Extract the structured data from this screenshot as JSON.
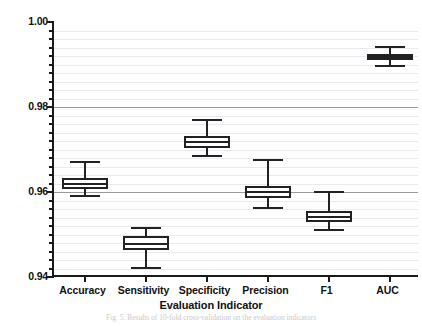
{
  "figure": {
    "width": 422,
    "height": 327,
    "background": "#ffffff",
    "line_color": "#222222",
    "grid_major_color": "#9a9a9a",
    "grid_minor_color": "#e9e9ef",
    "caption": "Fig. 5. Results of 10-fold cross-validation on the evaluation indicators"
  },
  "chart_data": {
    "type": "box",
    "title": "",
    "xlabel": "Evaluation Indicator",
    "ylabel": "",
    "ylim": [
      0.94,
      1.0
    ],
    "ytick_labels": [
      "0.94",
      "0.96",
      "0.98",
      "1.00"
    ],
    "ytick_values": [
      0.94,
      0.96,
      0.98,
      1.0
    ],
    "ytick_minor_step": 0.002,
    "grid": true,
    "legend": "none",
    "categories": [
      "Accuracy",
      "Sensitivity",
      "Specificity",
      "Precision",
      "F1",
      "AUC"
    ],
    "boxes": [
      {
        "name": "Accuracy",
        "whisker_high": 0.9671,
        "q3": 0.9633,
        "median": 0.9619,
        "q1": 0.9607,
        "whisker_low": 0.9591
      },
      {
        "name": "Sensitivity",
        "whisker_high": 0.9515,
        "q3": 0.9497,
        "median": 0.9478,
        "q1": 0.9464,
        "whisker_low": 0.9421
      },
      {
        "name": "Specificity",
        "whisker_high": 0.9769,
        "q3": 0.9732,
        "median": 0.9718,
        "q1": 0.9704,
        "whisker_low": 0.9685
      },
      {
        "name": "Precision",
        "whisker_high": 0.9675,
        "q3": 0.9614,
        "median": 0.96,
        "q1": 0.9586,
        "whisker_low": 0.9562
      },
      {
        "name": "F1",
        "whisker_high": 0.96,
        "q3": 0.9555,
        "median": 0.9541,
        "q1": 0.9529,
        "whisker_low": 0.9511
      },
      {
        "name": "AUC",
        "whisker_high": 0.9941,
        "q3": 0.9925,
        "median": 0.9918,
        "q1": 0.9911,
        "whisker_low": 0.9897
      }
    ]
  }
}
